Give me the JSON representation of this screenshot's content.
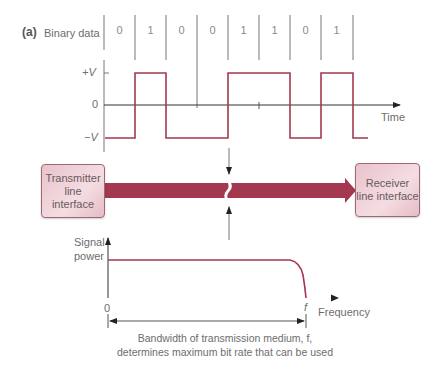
{
  "figure": {
    "part_label": "(a)",
    "binary_data_label": "Binary data",
    "bits": [
      "0",
      "1",
      "0",
      "0",
      "1",
      "1",
      "0",
      "1"
    ],
    "levels": {
      "plus_v": "+V",
      "zero": "0",
      "minus_v": "−V"
    },
    "time_axis_label": "Time",
    "transmitter_box": {
      "line1": "Transmitter",
      "line2": "line interface"
    },
    "receiver_box": {
      "line1": "Receiver",
      "line2": "line interface"
    },
    "spectrum": {
      "y_axis_label_line1": "Signal",
      "y_axis_label_line2": "power",
      "x_origin_label": "0",
      "cutoff_label": "f",
      "x_axis_label": "Frequency"
    },
    "caption_line1": "Bandwidth of transmission medium, f,",
    "caption_line2": "determines maximum bit rate that can be used",
    "colors": {
      "waveform": "#a3384f",
      "channel_bar": "#a3384f",
      "box_fill": "#efd2d8",
      "axis": "#333333",
      "guide_lines": "#777777"
    }
  }
}
